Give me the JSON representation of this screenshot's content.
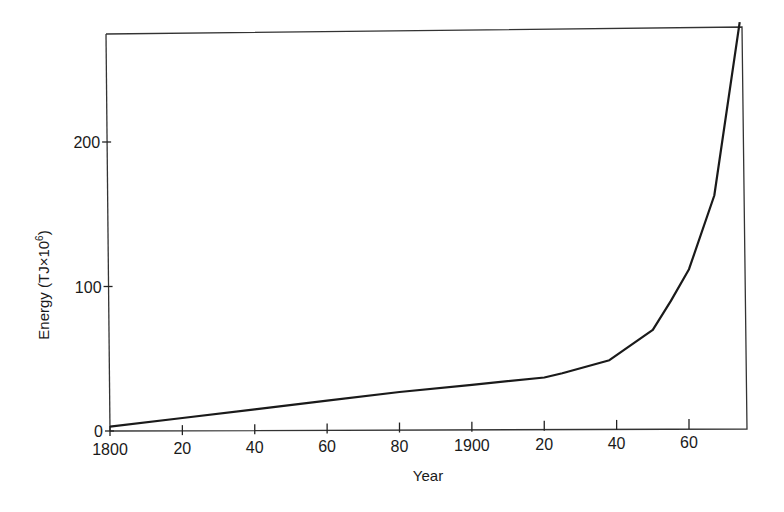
{
  "chart_data": {
    "type": "line",
    "title": "",
    "xlabel": "Year",
    "ylabel": "Energy (TJ×10",
    "ylabel_superscript": "6",
    "ylabel_close": ")",
    "xlim": [
      1800,
      1975
    ],
    "ylim": [
      0,
      285
    ],
    "grid": false,
    "legend": null,
    "x_ticks": [
      {
        "value": 1800,
        "label": "1800"
      },
      {
        "value": 1820,
        "label": "20"
      },
      {
        "value": 1840,
        "label": "40"
      },
      {
        "value": 1860,
        "label": "60"
      },
      {
        "value": 1880,
        "label": "80"
      },
      {
        "value": 1900,
        "label": "1900"
      },
      {
        "value": 1920,
        "label": "20"
      },
      {
        "value": 1940,
        "label": "40"
      },
      {
        "value": 1960,
        "label": "60"
      }
    ],
    "y_ticks": [
      {
        "value": 0,
        "label": "0"
      },
      {
        "value": 100,
        "label": "100"
      },
      {
        "value": 200,
        "label": "200"
      }
    ],
    "series": [
      {
        "name": "World energy consumption",
        "color": "#1a1a1a",
        "x": [
          1800,
          1820,
          1840,
          1860,
          1880,
          1900,
          1920,
          1925,
          1938,
          1950,
          1955,
          1960,
          1967,
          1974
        ],
        "values": [
          3,
          9,
          15,
          21,
          27,
          32,
          37,
          40,
          49,
          70,
          90,
          112,
          163,
          283
        ]
      }
    ]
  }
}
